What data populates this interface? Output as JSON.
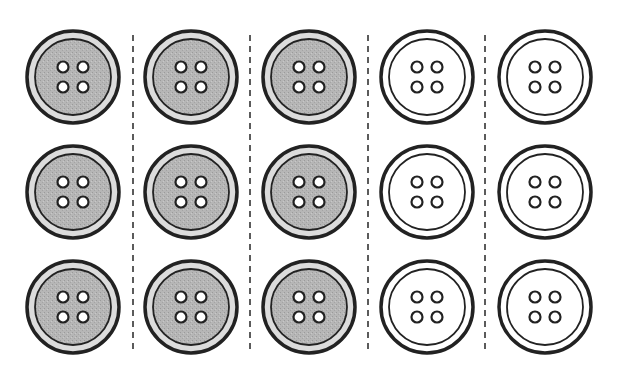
{
  "figure": {
    "rows": 3,
    "columns": 5,
    "column_centers_x": [
      73,
      191,
      309,
      427,
      545
    ],
    "row_centers_y": [
      77,
      192,
      307
    ],
    "divider_x": [
      133,
      250,
      368,
      485
    ],
    "divider_y_range": [
      35,
      352
    ],
    "button_outer_radius": 46,
    "button_inner_radius": 38,
    "hole_offset": 10,
    "hole_radius": 5.5,
    "columns_style": [
      "shaded",
      "shaded",
      "shaded",
      "plain",
      "plain"
    ],
    "counts": {
      "shaded": 9,
      "plain": 6,
      "total": 15
    },
    "colors": {
      "outline": "#222222",
      "shaded_face": "#b8b8b8",
      "shaded_rim": "#dcdcdc",
      "plain_face": "#ffffff",
      "hole": "#ffffff",
      "divider": "#333333",
      "background": "#ffffff"
    }
  }
}
